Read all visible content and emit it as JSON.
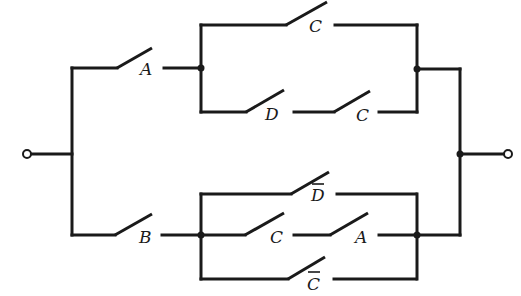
{
  "diagram": {
    "type": "switching-circuit",
    "terminals": [
      {
        "id": "input",
        "x": 27,
        "y": 154
      },
      {
        "id": "output",
        "x": 508,
        "y": 154
      }
    ],
    "switches": [
      {
        "id": "sw-A-top",
        "label": "A",
        "complemented": false,
        "branch": "upper-series"
      },
      {
        "id": "sw-C-upper",
        "label": "C",
        "complemented": false,
        "branch": "upper-parallel-1"
      },
      {
        "id": "sw-D-upper",
        "label": "D",
        "complemented": false,
        "branch": "upper-parallel-2"
      },
      {
        "id": "sw-C-upper2",
        "label": "C",
        "complemented": false,
        "branch": "upper-parallel-2"
      },
      {
        "id": "sw-B",
        "label": "B",
        "complemented": false,
        "branch": "lower-series"
      },
      {
        "id": "sw-Dbar",
        "label": "D",
        "complemented": true,
        "branch": "lower-parallel-1"
      },
      {
        "id": "sw-C-lower",
        "label": "C",
        "complemented": false,
        "branch": "lower-parallel-2"
      },
      {
        "id": "sw-A-lower",
        "label": "A",
        "complemented": false,
        "branch": "lower-parallel-2"
      },
      {
        "id": "sw-Cbar",
        "label": "C",
        "complemented": true,
        "branch": "lower-parallel-3"
      }
    ],
    "labels": {
      "a_top": "A",
      "c_top": "C",
      "d_mid": "D",
      "c_mid": "C",
      "b": "B",
      "d_bar": "D",
      "c_low": "C",
      "a_low": "A",
      "c_bar": "C"
    },
    "colors": {
      "line": "#1a1a1a",
      "background": "#ffffff"
    }
  }
}
